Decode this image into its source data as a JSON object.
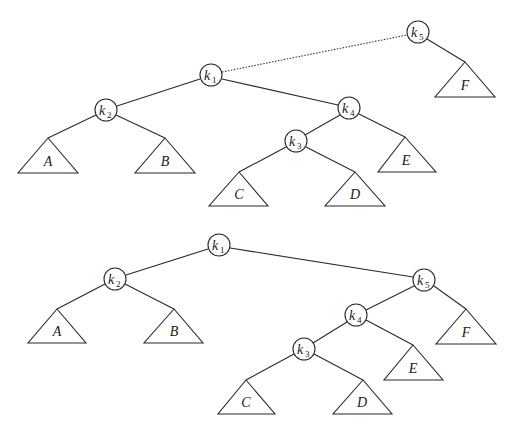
{
  "figure": {
    "top_tree": {
      "nodes": [
        {
          "id": "k5",
          "base": "k",
          "sub": "5",
          "x": 418,
          "y": 32
        },
        {
          "id": "k1",
          "base": "k",
          "sub": "1",
          "x": 211,
          "y": 75
        },
        {
          "id": "k2",
          "base": "k",
          "sub": "2",
          "x": 106,
          "y": 110
        },
        {
          "id": "k4",
          "base": "k",
          "sub": "4",
          "x": 349,
          "y": 108
        },
        {
          "id": "k3",
          "base": "k",
          "sub": "3",
          "x": 296,
          "y": 141
        }
      ],
      "subtrees": [
        {
          "label": "A",
          "apex": [
            48,
            138
          ],
          "left": [
            18,
            173
          ],
          "right": [
            78,
            173
          ]
        },
        {
          "label": "B",
          "apex": [
            165,
            138
          ],
          "left": [
            135,
            173
          ],
          "right": [
            195,
            173
          ]
        },
        {
          "label": "C",
          "apex": [
            239,
            172
          ],
          "left": [
            209,
            206
          ],
          "right": [
            268,
            206
          ]
        },
        {
          "label": "D",
          "apex": [
            355,
            172
          ],
          "left": [
            325,
            206
          ],
          "right": [
            385,
            206
          ]
        },
        {
          "label": "E",
          "apex": [
            405,
            137
          ],
          "left": [
            378,
            172
          ],
          "right": [
            436,
            172
          ]
        },
        {
          "label": "F",
          "apex": [
            465,
            62
          ],
          "left": [
            435,
            97
          ],
          "right": [
            495,
            97
          ]
        }
      ],
      "dotted_edge": [
        "k1",
        "k5"
      ]
    },
    "bottom_tree": {
      "nodes": [
        {
          "id": "k1",
          "base": "k",
          "sub": "1",
          "x": 219,
          "y": 245
        },
        {
          "id": "k2",
          "base": "k",
          "sub": "2",
          "x": 115,
          "y": 279
        },
        {
          "id": "k5",
          "base": "k",
          "sub": "5",
          "x": 424,
          "y": 280
        },
        {
          "id": "k4",
          "base": "k",
          "sub": "4",
          "x": 356,
          "y": 315
        },
        {
          "id": "k3",
          "base": "k",
          "sub": "3",
          "x": 304,
          "y": 349
        }
      ],
      "subtrees": [
        {
          "label": "A",
          "apex": [
            57,
            309
          ],
          "left": [
            28,
            343
          ],
          "right": [
            86,
            343
          ]
        },
        {
          "label": "B",
          "apex": [
            174,
            309
          ],
          "left": [
            144,
            343
          ],
          "right": [
            203,
            343
          ]
        },
        {
          "label": "C",
          "apex": [
            246,
            380
          ],
          "left": [
            218,
            414
          ],
          "right": [
            275,
            414
          ]
        },
        {
          "label": "D",
          "apex": [
            363,
            380
          ],
          "left": [
            333,
            414
          ],
          "right": [
            392,
            414
          ]
        },
        {
          "label": "E",
          "apex": [
            413,
            345
          ],
          "left": [
            384,
            380
          ],
          "right": [
            443,
            380
          ]
        },
        {
          "label": "F",
          "apex": [
            466,
            309
          ],
          "left": [
            436,
            344
          ],
          "right": [
            496,
            344
          ]
        }
      ]
    }
  },
  "labels": {
    "top": {
      "k5": "k",
      "k5_sub": "5",
      "k1": "k",
      "k1_sub": "1",
      "k2": "k",
      "k2_sub": "2",
      "k4": "k",
      "k4_sub": "4",
      "k3": "k",
      "k3_sub": "3",
      "A": "A",
      "B": "B",
      "C": "C",
      "D": "D",
      "E": "E",
      "F": "F"
    },
    "bottom": {
      "k1": "k",
      "k1_sub": "1",
      "k2": "k",
      "k2_sub": "2",
      "k5": "k",
      "k5_sub": "5",
      "k4": "k",
      "k4_sub": "4",
      "k3": "k",
      "k3_sub": "3",
      "A": "A",
      "B": "B",
      "C": "C",
      "D": "D",
      "E": "E",
      "F": "F"
    }
  }
}
